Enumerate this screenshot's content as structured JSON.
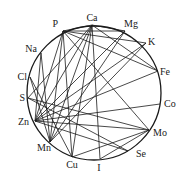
{
  "diagram": {
    "type": "chord-network",
    "circle": {
      "cx": 94,
      "cy": 93,
      "r": 67
    },
    "nodes": [
      {
        "id": "P",
        "label": "P",
        "x": 63,
        "y": 31,
        "lx": 58,
        "ly": 27,
        "anchor": "end"
      },
      {
        "id": "Ca",
        "label": "Ca",
        "x": 92,
        "y": 25,
        "lx": 92,
        "ly": 21,
        "anchor": "middle"
      },
      {
        "id": "Mg",
        "label": "Mg",
        "x": 125,
        "y": 31,
        "lx": 124,
        "ly": 27,
        "anchor": "start"
      },
      {
        "id": "K",
        "label": "K",
        "x": 146,
        "y": 43,
        "lx": 148,
        "ly": 45,
        "anchor": "start"
      },
      {
        "id": "Fe",
        "label": "Fe",
        "x": 158,
        "y": 71,
        "lx": 160,
        "ly": 75,
        "anchor": "start"
      },
      {
        "id": "Co",
        "label": "Co",
        "x": 160,
        "y": 104,
        "lx": 164,
        "ly": 107,
        "anchor": "start"
      },
      {
        "id": "Mo",
        "label": "Mo",
        "x": 149,
        "y": 130,
        "lx": 153,
        "ly": 136,
        "anchor": "start"
      },
      {
        "id": "Se",
        "label": "Se",
        "x": 128,
        "y": 151,
        "lx": 136,
        "ly": 157,
        "anchor": "start"
      },
      {
        "id": "I",
        "label": "I",
        "x": 100,
        "y": 159,
        "lx": 99,
        "ly": 171,
        "anchor": "middle"
      },
      {
        "id": "Cu",
        "label": "Cu",
        "x": 72,
        "y": 157,
        "lx": 72,
        "ly": 168,
        "anchor": "middle"
      },
      {
        "id": "Mn",
        "label": "Mn",
        "x": 50,
        "y": 142,
        "lx": 44,
        "ly": 151,
        "anchor": "middle"
      },
      {
        "id": "Zn",
        "label": "Zn",
        "x": 35,
        "y": 121,
        "lx": 29,
        "ly": 125,
        "anchor": "end"
      },
      {
        "id": "S",
        "label": "S",
        "x": 28,
        "y": 98,
        "lx": 25,
        "ly": 101,
        "anchor": "end"
      },
      {
        "id": "Cl",
        "label": "Cl",
        "x": 30,
        "y": 77,
        "lx": 27,
        "ly": 80,
        "anchor": "end"
      },
      {
        "id": "Na",
        "label": "Na",
        "x": 41,
        "y": 53,
        "lx": 37,
        "ly": 52,
        "anchor": "end"
      }
    ],
    "edges": [
      [
        "P",
        "Mg"
      ],
      [
        "P",
        "K"
      ],
      [
        "P",
        "Fe"
      ],
      [
        "P",
        "Mo"
      ],
      [
        "P",
        "Zn"
      ],
      [
        "P",
        "Mn"
      ],
      [
        "P",
        "Cu"
      ],
      [
        "P",
        "Ca"
      ],
      [
        "Ca",
        "Mg"
      ],
      [
        "Ca",
        "Zn"
      ],
      [
        "Ca",
        "Mn"
      ],
      [
        "Ca",
        "Cu"
      ],
      [
        "Ca",
        "I"
      ],
      [
        "Ca",
        "Fe"
      ],
      [
        "Ca",
        "S"
      ],
      [
        "Na",
        "Mn"
      ],
      [
        "Na",
        "Zn"
      ],
      [
        "Cl",
        "Cu"
      ],
      [
        "Cl",
        "Mn"
      ],
      [
        "S",
        "Se"
      ],
      [
        "S",
        "Mo"
      ],
      [
        "Zn",
        "Co"
      ],
      [
        "Zn",
        "Fe"
      ],
      [
        "Zn",
        "K"
      ],
      [
        "Zn",
        "Mo"
      ],
      [
        "Zn",
        "Mg"
      ],
      [
        "Zn",
        "Se"
      ],
      [
        "Mo",
        "Cu"
      ],
      [
        "Mo",
        "I"
      ],
      [
        "Mn",
        "K"
      ],
      [
        "Mn",
        "Mg"
      ]
    ]
  }
}
